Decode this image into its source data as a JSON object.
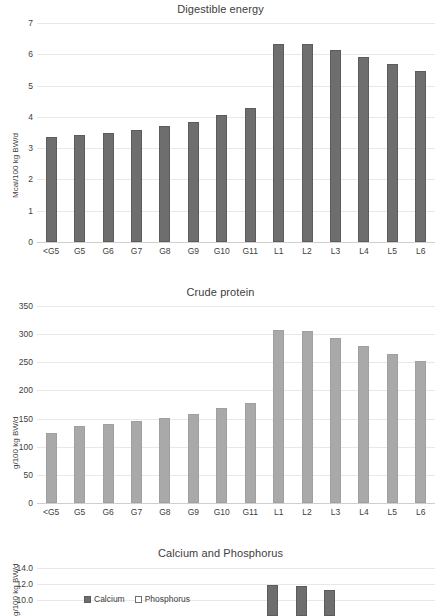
{
  "figure": {
    "panels": [
      "Digestible energy",
      "Crude protein",
      "Calcium and Phosphorus"
    ]
  },
  "chart_data": [
    {
      "type": "bar",
      "title": "Digestible energy",
      "xlabel": "",
      "ylabel": "Mcal/100 kg BW/d",
      "categories": [
        "<G5",
        "G5",
        "G6",
        "G7",
        "G8",
        "G9",
        "G10",
        "G11",
        "L1",
        "L2",
        "L3",
        "L4",
        "L5",
        "L6"
      ],
      "values": [
        3.35,
        3.42,
        3.48,
        3.58,
        3.7,
        3.84,
        4.05,
        4.28,
        6.33,
        6.33,
        6.13,
        5.9,
        5.68,
        5.46
      ],
      "ylim": [
        0,
        7
      ],
      "yticks": [
        0,
        1,
        2,
        3,
        4,
        5,
        6,
        7
      ],
      "ytick_labels": [
        "0",
        "1",
        "2",
        "3",
        "4",
        "5",
        "6",
        "7"
      ],
      "grid": true,
      "legend": null,
      "bar_color": "#6e6e6e"
    },
    {
      "type": "bar",
      "title": "Crude protein",
      "xlabel": "",
      "ylabel": "g/100 kg BW/d",
      "categories": [
        "<G5",
        "G5",
        "G6",
        "G7",
        "G8",
        "G9",
        "G10",
        "G11",
        "L1",
        "L2",
        "L3",
        "L4",
        "L5",
        "L6"
      ],
      "values": [
        125,
        136,
        140,
        145,
        151,
        158,
        168,
        178,
        307,
        306,
        294,
        279,
        265,
        252
      ],
      "ylim": [
        0,
        350
      ],
      "yticks": [
        0,
        50,
        100,
        150,
        200,
        250,
        300,
        350
      ],
      "ytick_labels": [
        "0",
        "50",
        "100",
        "150",
        "200",
        "250",
        "300",
        "350"
      ],
      "grid": true,
      "legend": null,
      "bar_color": "#a9a9a9"
    },
    {
      "type": "bar",
      "title": "Calcium and Phosphorus",
      "xlabel": "",
      "ylabel": "g/100 kg BW/d",
      "categories": [
        "<G5",
        "G5",
        "G6",
        "G7",
        "G8",
        "G9",
        "G10",
        "G11",
        "L1",
        "L2",
        "L3",
        "L4",
        "L5",
        "L6"
      ],
      "series": [
        {
          "name": "Calcium",
          "color": "#6e6e6e",
          "values": [
            null,
            null,
            null,
            null,
            null,
            null,
            null,
            null,
            11.9,
            11.8,
            11.3,
            null,
            null,
            null
          ]
        },
        {
          "name": "Phosphorus",
          "color": "#ffffff",
          "values": [
            null,
            null,
            null,
            null,
            null,
            null,
            null,
            null,
            null,
            null,
            null,
            null,
            null,
            null
          ]
        }
      ],
      "ylim": [
        0,
        14
      ],
      "yticks": [
        10.0,
        12.0,
        14.0
      ],
      "ytick_labels": [
        "10.0",
        "12.0",
        "14.0"
      ],
      "grid": true,
      "legend": {
        "position": "inside-left",
        "entries": [
          "Calcium",
          "Phosphorus"
        ]
      },
      "note": "panel truncated at bottom of image"
    }
  ]
}
